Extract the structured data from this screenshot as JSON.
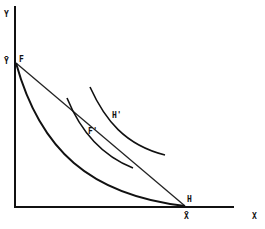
{
  "diagram": {
    "type": "economics-indifference-curve-diagram",
    "axes": {
      "y_label": "Y",
      "x_label": "X",
      "y_intercept_label": "Ȳ",
      "x_intercept_label": "X̄"
    },
    "points": {
      "F": "F",
      "H": "H",
      "F_prime": "F'",
      "H_prime": "H'"
    },
    "elements": [
      "straight budget line from F to H",
      "convex production-possibility curve from F to H",
      "indifference curve tangent/through F'",
      "indifference curve through H'"
    ],
    "colors": {
      "ink": "#111111",
      "background": "#ffffff"
    }
  }
}
